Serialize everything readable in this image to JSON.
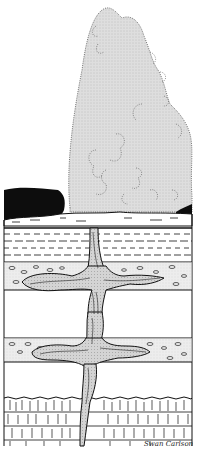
{
  "figure": {
    "clipped_header_text": "",
    "signature": "Swan Carlson",
    "colors": {
      "plume": "#d9d9d9",
      "ink": "#111111",
      "background": "#ffffff",
      "fill_conduit": "#cfcfcf"
    },
    "layers": [
      {
        "name": "steam-plume",
        "top": 8,
        "bottom": 212
      },
      {
        "name": "ground-surface-sinter",
        "top": 196,
        "bottom": 228
      },
      {
        "name": "dashed-sediment-layer",
        "top": 228,
        "bottom": 262
      },
      {
        "name": "gravel-layer-upper",
        "top": 262,
        "bottom": 290
      },
      {
        "name": "blank-layer-upper",
        "top": 290,
        "bottom": 338
      },
      {
        "name": "gravel-layer-lower",
        "top": 338,
        "bottom": 362
      },
      {
        "name": "blank-layer-lower",
        "top": 362,
        "bottom": 398
      },
      {
        "name": "bedrock-brick-layer",
        "top": 398,
        "bottom": 446
      }
    ]
  }
}
